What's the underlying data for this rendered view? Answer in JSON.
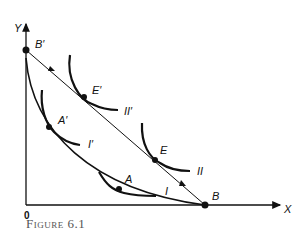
{
  "figure": {
    "caption": "Figure 6.1",
    "axes": {
      "x_label": "X",
      "y_label": "Y",
      "origin_label": "0"
    },
    "points": {
      "B_prime": "B′",
      "B": "B",
      "E_prime": "E′",
      "E": "E",
      "A_prime": "A′",
      "A": "A"
    },
    "curves": {
      "I_prime": "I′",
      "II_prime": "II′",
      "I": "I",
      "II": "II"
    },
    "colors": {
      "ink": "#111111",
      "caption": "#555555"
    }
  }
}
